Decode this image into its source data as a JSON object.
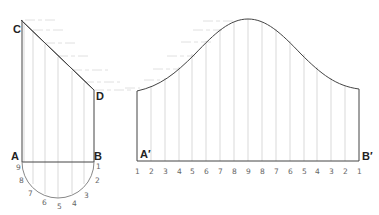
{
  "diagram": {
    "type": "cylinder-development",
    "elevation": {
      "labels": {
        "a": "A",
        "b": "B",
        "c": "C",
        "d": "D"
      },
      "semicircle_numbers": [
        "9",
        "8",
        "7",
        "6",
        "5",
        "4",
        "3",
        "2",
        "1"
      ]
    },
    "development": {
      "labels": {
        "a_prime": "A′",
        "b_prime": "B′"
      },
      "baseline_numbers": [
        "1",
        "2",
        "3",
        "4",
        "5",
        "6",
        "7",
        "8",
        "9",
        "8",
        "7",
        "6",
        "5",
        "4",
        "3",
        "2",
        "1"
      ]
    }
  },
  "colors": {
    "outline": "#444444",
    "construction": "#cfcfcf",
    "text": "#222222",
    "numbers": "#666666"
  }
}
